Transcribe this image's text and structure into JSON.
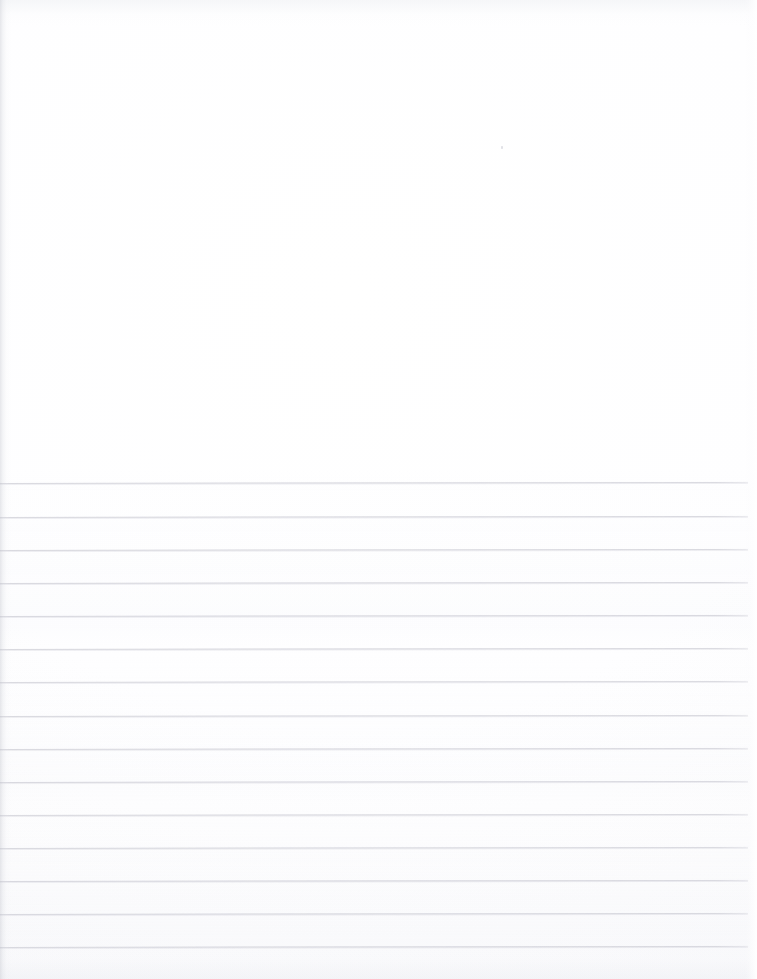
{
  "document": {
    "kind": "scanned-lined-paper",
    "title": "Blank Ruled Notebook Page",
    "page_width": 757,
    "page_height": 979,
    "background_color": "#ffffff",
    "paper_tone": "#fdfdfe",
    "has_visible_text": false,
    "has_handwriting": false,
    "text_content": "",
    "orientation": "portrait"
  },
  "header_region": {
    "label": "unruled header area",
    "top": 0,
    "height": 483,
    "content": "",
    "artifacts": [
      {
        "name": "dust-speck",
        "x": 501,
        "y": 146
      }
    ]
  },
  "ruled_region": {
    "label": "ruled writing area",
    "line_color": "#dcdce1",
    "line_thickness_px": 1,
    "line_count": 15,
    "line_spacing_px": 33.1,
    "first_line_y": 483,
    "last_line_y": 947,
    "line_start_x": 0,
    "line_end_x": 748,
    "skew_degrees": -0.085,
    "line_y_positions": [
      483,
      517,
      550,
      583,
      616,
      649,
      682,
      716,
      749,
      782,
      815,
      848,
      881,
      914,
      947
    ]
  },
  "edges": {
    "left_shadow_color": "#c4c6ce",
    "left_shadow_width": 11,
    "right_highlight_color": "#ffffff",
    "right_highlight_width": 12,
    "top_shadow_color": "#e2e4ea",
    "bottom_shadow_color": "#e6e8ee"
  }
}
